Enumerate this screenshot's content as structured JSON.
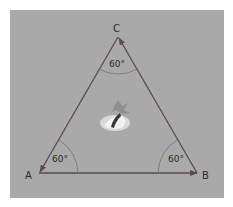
{
  "diagram": {
    "background": "#a9a9a9",
    "line_color": "#5a4a52",
    "vertices": [
      {
        "label": "A",
        "x": 39,
        "y": 173
      },
      {
        "label": "B",
        "x": 197,
        "y": 173
      },
      {
        "label": "C",
        "x": 118,
        "y": 37
      }
    ],
    "angles": [
      {
        "vertex": "A",
        "value": "60°"
      },
      {
        "vertex": "B",
        "value": "60°"
      },
      {
        "vertex": "C",
        "value": "60°"
      }
    ],
    "center_icon": "bird-icon"
  }
}
